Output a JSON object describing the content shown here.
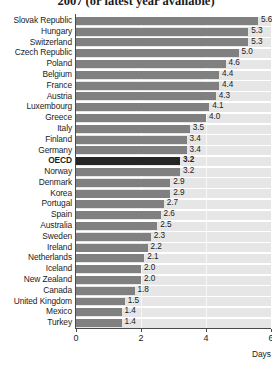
{
  "chart_data": {
    "type": "bar",
    "orientation": "horizontal",
    "title": "2007 (or latest year available)",
    "xlabel": "Days",
    "ylabel": "",
    "xlim": [
      0,
      6
    ],
    "xticks": [
      0,
      2,
      4,
      6
    ],
    "grid": "vertical",
    "legend": "none",
    "highlight": "OECD",
    "categories": [
      "Slovak Republic",
      "Hungary",
      "Switzerland",
      "Czech Republic",
      "Poland",
      "Belgium",
      "France",
      "Austria",
      "Luxembourg",
      "Greece",
      "Italy",
      "Finland",
      "Germany",
      "OECD",
      "Norway",
      "Denmark",
      "Korea",
      "Portugal",
      "Spain",
      "Australia",
      "Sweden",
      "Ireland",
      "Netherlands",
      "Iceland",
      "New Zealand",
      "Canada",
      "United Kingdom",
      "Mexico",
      "Turkey"
    ],
    "values": [
      5.6,
      5.3,
      5.3,
      5.0,
      4.6,
      4.4,
      4.4,
      4.3,
      4.1,
      4.0,
      3.5,
      3.4,
      3.4,
      3.2,
      3.2,
      2.9,
      2.9,
      2.7,
      2.6,
      2.5,
      2.3,
      2.2,
      2.1,
      2.0,
      2.0,
      1.8,
      1.5,
      1.4,
      1.4
    ],
    "value_labels": [
      "5.6",
      "5.3",
      "5.3",
      "5.0",
      "4.6",
      "4.4",
      "4.4",
      "4.3",
      "4.1",
      "4.0",
      "3.5",
      "3.4",
      "3.4",
      "3.2",
      "3.2",
      "2.9",
      "2.9",
      "2.7",
      "2.6",
      "2.5",
      "2.3",
      "2.2",
      "2.1",
      "2.0",
      "2.0",
      "1.8",
      "1.5",
      "1.4",
      "1.4"
    ],
    "tick_labels": [
      "0",
      "2",
      "4",
      "6"
    ],
    "colors": {
      "bar": "#808080",
      "bar_highlight": "#262626",
      "plot_background": "#e6e6e6",
      "row_separator": "#ffffff",
      "axis": "#4a4a4a",
      "text": "#1b1b1b"
    }
  }
}
